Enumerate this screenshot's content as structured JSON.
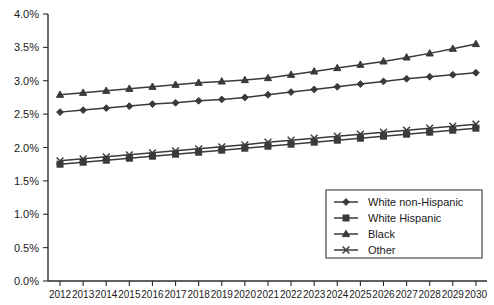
{
  "chart_data": {
    "type": "line",
    "title": "",
    "subtitle": "",
    "xlabel": "",
    "ylabel": "",
    "grid": false,
    "legend_position": "bottom-right",
    "ylim": [
      0.0,
      4.0
    ],
    "y_tick_labels": [
      "0.0%",
      "0.5%",
      "1.0%",
      "1.5%",
      "2.0%",
      "2.5%",
      "3.0%",
      "3.5%",
      "4.0%"
    ],
    "y_tick_values": [
      0.0,
      0.5,
      1.0,
      1.5,
      2.0,
      2.5,
      3.0,
      3.5,
      4.0
    ],
    "categories": [
      "2012",
      "2013",
      "2014",
      "2015",
      "2016",
      "2017",
      "2018",
      "2019",
      "2020",
      "2021",
      "2022",
      "2023",
      "2024",
      "2025",
      "2026",
      "2027",
      "2028",
      "2029",
      "2030"
    ],
    "x": [
      2012,
      2013,
      2014,
      2015,
      2016,
      2017,
      2018,
      2019,
      2020,
      2021,
      2022,
      2023,
      2024,
      2025,
      2026,
      2027,
      2028,
      2029,
      2030
    ],
    "series": [
      {
        "name": "White non-Hispanic",
        "marker": "diamond",
        "color": "#3a3a3a",
        "values": [
          2.53,
          2.56,
          2.59,
          2.62,
          2.65,
          2.67,
          2.7,
          2.72,
          2.75,
          2.79,
          2.83,
          2.87,
          2.91,
          2.95,
          2.99,
          3.03,
          3.06,
          3.09,
          3.12
        ]
      },
      {
        "name": "White Hispanic",
        "marker": "square",
        "color": "#3a3a3a",
        "values": [
          1.75,
          1.78,
          1.81,
          1.84,
          1.87,
          1.9,
          1.93,
          1.96,
          1.99,
          2.02,
          2.05,
          2.08,
          2.11,
          2.14,
          2.17,
          2.2,
          2.23,
          2.26,
          2.29
        ]
      },
      {
        "name": "Black",
        "marker": "triangle",
        "color": "#3a3a3a",
        "values": [
          2.79,
          2.82,
          2.85,
          2.88,
          2.91,
          2.94,
          2.97,
          2.99,
          3.01,
          3.04,
          3.09,
          3.14,
          3.19,
          3.24,
          3.29,
          3.35,
          3.41,
          3.48,
          3.55
        ]
      },
      {
        "name": "Other",
        "marker": "x",
        "color": "#3a3a3a",
        "values": [
          1.8,
          1.83,
          1.86,
          1.89,
          1.92,
          1.95,
          1.98,
          2.01,
          2.04,
          2.08,
          2.11,
          2.14,
          2.17,
          2.2,
          2.23,
          2.26,
          2.29,
          2.32,
          2.35
        ]
      }
    ]
  },
  "legend": {
    "entries": [
      {
        "label": "White non-Hispanic",
        "marker": "diamond"
      },
      {
        "label": "White Hispanic",
        "marker": "square"
      },
      {
        "label": "Black",
        "marker": "triangle"
      },
      {
        "label": "Other",
        "marker": "x"
      }
    ]
  }
}
